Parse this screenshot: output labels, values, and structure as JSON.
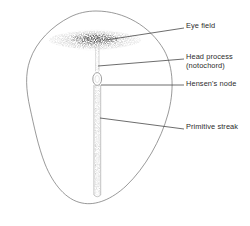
{
  "figure": {
    "kind": "biological-diagram",
    "ink_color": "#555555",
    "stipple_color": "#3a3a3a",
    "text_color": "#2b2b2b",
    "background_color": "#ffffff"
  },
  "structures": {
    "outline": {
      "name": "blastoderm-outline"
    },
    "eye_field": {
      "name": "eye-field-stipple"
    },
    "head_process": {
      "name": "head-process-band"
    },
    "hensens_node": {
      "name": "hensens-node-oval"
    },
    "primitive_streak": {
      "name": "primitive-streak-band"
    }
  },
  "labels": [
    {
      "id": "eye-field",
      "text": "Eye field",
      "x": 186,
      "y": 25,
      "leader": {
        "x1": 106,
        "y1": 40,
        "x2": 184,
        "y2": 28
      }
    },
    {
      "id": "head-process",
      "text": "Head process",
      "text2": "(notochord)",
      "x": 186,
      "y": 56,
      "leader": {
        "x1": 98,
        "y1": 66,
        "x2": 184,
        "y2": 59
      }
    },
    {
      "id": "hensens-node",
      "text": "Hensen's node",
      "x": 186,
      "y": 83,
      "leader": {
        "x1": 100,
        "y1": 85,
        "x2": 184,
        "y2": 85
      }
    },
    {
      "id": "primitive-streak",
      "text": "Primitive streak",
      "x": 186,
      "y": 125,
      "leader": {
        "x1": 100,
        "y1": 118,
        "x2": 184,
        "y2": 129
      }
    }
  ]
}
